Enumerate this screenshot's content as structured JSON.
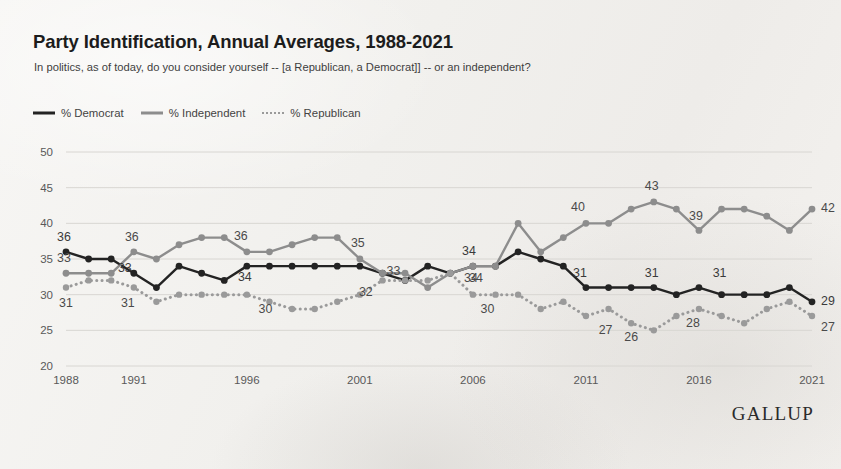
{
  "header": {
    "title": "Party Identification, Annual Averages, 1988-2021",
    "subtitle": "In politics, as of today, do you consider yourself -- [a Republican, a Democrat]] -- or an independent?"
  },
  "branding": {
    "logo": "GALLUP"
  },
  "legend": {
    "position": "top-left",
    "items": [
      {
        "label": "% Democrat",
        "style": "solid-dark",
        "color": "#232323"
      },
      {
        "label": "% Independent",
        "style": "solid-gray",
        "color": "#8d8d8d"
      },
      {
        "label": "% Republican",
        "style": "dotted-gray",
        "color": "#9a9a9a"
      }
    ]
  },
  "chart_data": {
    "type": "line",
    "title": "Party Identification, Annual Averages, 1988-2021",
    "subtitle": "In politics, as of today, do you consider yourself -- [a Republican, a Democrat]] -- or an independent?",
    "xlabel": "",
    "ylabel": "",
    "grid": true,
    "xlim": [
      1988,
      2021
    ],
    "ylim": [
      20,
      50
    ],
    "y_ticks": [
      20,
      25,
      30,
      35,
      40,
      45,
      50
    ],
    "x_ticks": [
      1988,
      1991,
      1996,
      2001,
      2006,
      2011,
      2016,
      2021
    ],
    "x": [
      1988,
      1989,
      1990,
      1991,
      1992,
      1993,
      1994,
      1995,
      1996,
      1997,
      1998,
      1999,
      2000,
      2001,
      2002,
      2003,
      2004,
      2005,
      2006,
      2007,
      2008,
      2009,
      2010,
      2011,
      2012,
      2013,
      2014,
      2015,
      2016,
      2017,
      2018,
      2019,
      2020,
      2021
    ],
    "series": [
      {
        "name": "% Democrat",
        "color": "#232323",
        "style": "solid",
        "values": [
          36,
          35,
          35,
          33,
          31,
          34,
          33,
          32,
          34,
          34,
          34,
          34,
          34,
          34,
          33,
          32,
          34,
          33,
          34,
          34,
          36,
          35,
          34,
          31,
          31,
          31,
          31,
          30,
          31,
          30,
          30,
          30,
          31,
          29
        ]
      },
      {
        "name": "% Independent",
        "color": "#8d8d8d",
        "style": "solid",
        "values": [
          33,
          33,
          33,
          36,
          35,
          37,
          38,
          38,
          36,
          36,
          37,
          38,
          38,
          35,
          33,
          33,
          31,
          33,
          34,
          34,
          40,
          36,
          38,
          40,
          40,
          42,
          43,
          42,
          39,
          42,
          42,
          41,
          39,
          42
        ]
      },
      {
        "name": "% Republican",
        "color": "#9a9a9a",
        "style": "dotted",
        "values": [
          31,
          32,
          32,
          31,
          29,
          30,
          30,
          30,
          30,
          29,
          28,
          28,
          29,
          30,
          32,
          32,
          32,
          33,
          30,
          30,
          30,
          28,
          29,
          27,
          28,
          26,
          25,
          27,
          28,
          27,
          26,
          28,
          29,
          27
        ]
      }
    ],
    "annotations": [
      {
        "series": "% Democrat",
        "year": 1988,
        "value": 36,
        "text": "36"
      },
      {
        "series": "% Democrat",
        "year": 1991,
        "value": 33,
        "text": "33"
      },
      {
        "series": "% Democrat",
        "year": 1996,
        "value": 34,
        "text": "34"
      },
      {
        "series": "% Democrat",
        "year": 2006,
        "value": 34,
        "text": "34"
      },
      {
        "series": "% Democrat",
        "year": 2011,
        "value": 31,
        "text": "31"
      },
      {
        "series": "% Democrat",
        "year": 2014,
        "value": 31,
        "text": "31"
      },
      {
        "series": "% Democrat",
        "year": 2017,
        "value": 31,
        "text": "31"
      },
      {
        "series": "% Democrat",
        "year": 2021,
        "value": 29,
        "text": "29"
      },
      {
        "series": "% Independent",
        "year": 1988,
        "value": 33,
        "text": "33"
      },
      {
        "series": "% Independent",
        "year": 1991,
        "value": 36,
        "text": "36"
      },
      {
        "series": "% Independent",
        "year": 1996,
        "value": 36,
        "text": "36"
      },
      {
        "series": "% Independent",
        "year": 2001,
        "value": 35,
        "text": "35"
      },
      {
        "series": "% Independent",
        "year": 2002,
        "value": 33,
        "text": "33"
      },
      {
        "series": "% Independent",
        "year": 2006,
        "value": 34,
        "text": "34"
      },
      {
        "series": "% Independent",
        "year": 2011,
        "value": 40,
        "text": "40"
      },
      {
        "series": "% Independent",
        "year": 2014,
        "value": 43,
        "text": "43"
      },
      {
        "series": "% Independent",
        "year": 2016,
        "value": 39,
        "text": "39"
      },
      {
        "series": "% Independent",
        "year": 2021,
        "value": 42,
        "text": "42"
      },
      {
        "series": "% Republican",
        "year": 1988,
        "value": 31,
        "text": "31"
      },
      {
        "series": "% Republican",
        "year": 1991,
        "value": 31,
        "text": "31"
      },
      {
        "series": "% Republican",
        "year": 1997,
        "value": 30,
        "text": "30"
      },
      {
        "series": "% Republican",
        "year": 2001,
        "value": 32,
        "text": "32"
      },
      {
        "series": "% Republican",
        "year": 2006,
        "value": 34,
        "text": "34"
      },
      {
        "series": "% Republican",
        "year": 2007,
        "value": 30,
        "text": "30"
      },
      {
        "series": "% Republican",
        "year": 2012,
        "value": 27,
        "text": "27"
      },
      {
        "series": "% Republican",
        "year": 2013,
        "value": 26,
        "text": "26"
      },
      {
        "series": "% Republican",
        "year": 2016,
        "value": 28,
        "text": "28"
      },
      {
        "series": "% Republican",
        "year": 2021,
        "value": 27,
        "text": "27"
      }
    ]
  }
}
